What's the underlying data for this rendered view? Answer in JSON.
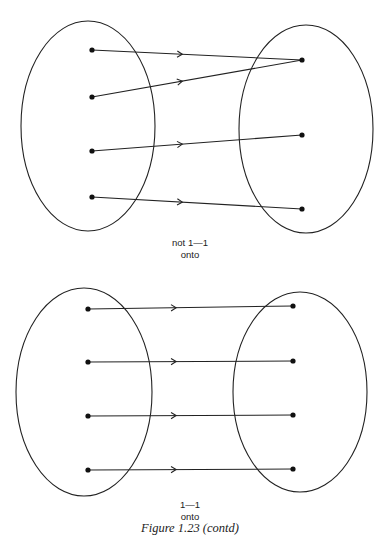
{
  "figures": [
    {
      "id": "top",
      "label_line1": "not 1—1",
      "label_line2": "onto",
      "left_set": {
        "ellipse": {
          "cx": 88,
          "cy": 126,
          "rx": 67,
          "ry": 105
        },
        "points": [
          [
            92,
            50
          ],
          [
            92,
            97
          ],
          [
            92,
            151
          ],
          [
            92,
            197
          ]
        ]
      },
      "right_set": {
        "ellipse": {
          "cx": 306,
          "cy": 129,
          "rx": 67,
          "ry": 104
        },
        "points": [
          [
            302,
            60
          ],
          [
            302,
            135
          ],
          [
            302,
            209
          ]
        ]
      },
      "mappings": [
        [
          0,
          0
        ],
        [
          1,
          0
        ],
        [
          2,
          1
        ],
        [
          3,
          2
        ]
      ]
    },
    {
      "id": "bottom",
      "label_line1": "1—1",
      "label_line2": "onto",
      "left_set": {
        "ellipse": {
          "cx": 84,
          "cy": 392,
          "rx": 68,
          "ry": 104
        },
        "points": [
          [
            88,
            309
          ],
          [
            88,
            362
          ],
          [
            88,
            416
          ],
          [
            88,
            470
          ]
        ]
      },
      "right_set": {
        "ellipse": {
          "cx": 300,
          "cy": 392,
          "rx": 67,
          "ry": 100
        },
        "points": [
          [
            293,
            306
          ],
          [
            293,
            361
          ],
          [
            293,
            415
          ],
          [
            293,
            469
          ]
        ]
      },
      "mappings": [
        [
          0,
          0
        ],
        [
          1,
          1
        ],
        [
          2,
          2
        ],
        [
          3,
          3
        ]
      ]
    }
  ],
  "caption": "Figure 1.23 (contd)"
}
